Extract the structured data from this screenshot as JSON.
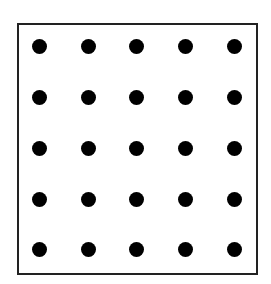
{
  "diagram": {
    "title": "",
    "frame": {
      "stroke": "#222222"
    },
    "grid": {
      "rows": 5,
      "cols": 5,
      "dot_color": "#000000",
      "x_positions": [
        39,
        88,
        136,
        185,
        234
      ],
      "y_positions": [
        46,
        97,
        148,
        199,
        249
      ]
    }
  }
}
